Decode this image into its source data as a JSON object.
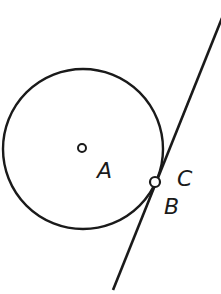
{
  "diagram": {
    "stroke_color": "#1a1a1a",
    "circle": {
      "center_label": "A",
      "cx": 83,
      "cy": 149,
      "r": 80
    },
    "center_point": {
      "cx": 82,
      "cy": 148,
      "r": 4
    },
    "tangent_line": {
      "x1": 222,
      "y1": 18,
      "x2": 113,
      "y2": 290
    },
    "tangent_point": {
      "cx": 155,
      "cy": 182,
      "r": 5
    },
    "labels": {
      "A": "A",
      "B": "B",
      "C": "C"
    }
  }
}
